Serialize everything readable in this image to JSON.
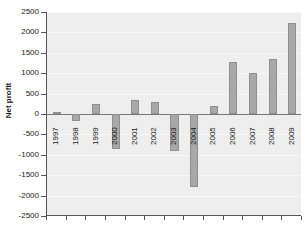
{
  "chart_data": {
    "type": "bar",
    "title": "",
    "subtitle": "",
    "xlabel": "",
    "ylabel": "Net profit",
    "categories": [
      "1997",
      "1998",
      "1999",
      "2000",
      "2001",
      "2002",
      "2003",
      "2004",
      "2005",
      "2006",
      "2007",
      "2008",
      "2009"
    ],
    "values": [
      40,
      -170,
      250,
      -850,
      350,
      290,
      -900,
      -1780,
      200,
      1270,
      1010,
      1340,
      2220
    ],
    "ylim": [
      -2500,
      2500
    ],
    "ytick_labels": [
      "2500",
      "2000",
      "1500",
      "1000",
      "500",
      "0",
      "-500",
      "-1000",
      "-1500",
      "-2000",
      "-2500"
    ],
    "ytick_values": [
      2500,
      2000,
      1500,
      1000,
      500,
      0,
      -500,
      -1000,
      -1500,
      -2000,
      -2500
    ],
    "grid": true,
    "legend": "none",
    "bar_color": "#a8a8a8",
    "bar_edge_color": "#8f8f8f",
    "plot_background": "#eeeeee",
    "axis_color": "#555555",
    "zero_line_color": "#777777",
    "text_color": "#1a1a1a"
  }
}
